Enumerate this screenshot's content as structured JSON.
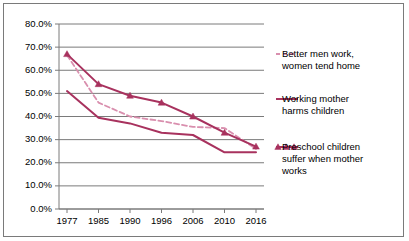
{
  "chart_data": {
    "type": "line",
    "title": "",
    "xlabel": "",
    "ylabel": "",
    "categories": [
      "1977",
      "1985",
      "1990",
      "1996",
      "2006",
      "2010",
      "2016"
    ],
    "ylim": [
      0,
      80
    ],
    "ytick_labels": [
      "0.0%",
      "10.0%",
      "20.0%",
      "30.0%",
      "40.0%",
      "50.0%",
      "60.0%",
      "70.0%",
      "80.0%"
    ],
    "ytick_values": [
      0,
      10,
      20,
      30,
      40,
      50,
      60,
      70,
      80
    ],
    "grid": "horizontal",
    "legend_position": "right",
    "series": [
      {
        "name": "Better men work, women tend home",
        "style": "dashed",
        "marker": "none",
        "color": "#D98FAE",
        "values": [
          66.5,
          46.0,
          40.0,
          38.0,
          35.5,
          35.0,
          26.0
        ]
      },
      {
        "name": "Working mother harms children",
        "style": "solid",
        "marker": "none",
        "color": "#A8325E",
        "values": [
          51.0,
          39.5,
          37.0,
          33.0,
          32.0,
          24.5,
          24.5
        ]
      },
      {
        "name": "Preschool children suffer when mother works",
        "style": "solid",
        "marker": "triangle",
        "color": "#A8325E",
        "values": [
          67.0,
          54.0,
          49.0,
          46.0,
          40.0,
          33.0,
          27.0
        ]
      }
    ]
  },
  "legend": {
    "items": [
      {
        "line1": "Better men work,",
        "line2": "women tend home",
        "line3": ""
      },
      {
        "line1": "Working mother",
        "line2": "harms children",
        "line3": ""
      },
      {
        "line1": "Preschool children",
        "line2": "suffer when mother",
        "line3": "works"
      }
    ]
  }
}
